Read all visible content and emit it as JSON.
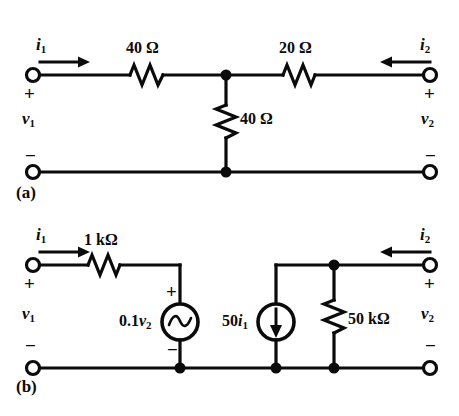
{
  "figure": {
    "ink_color": "#0b0b0b",
    "background": "#ffffff"
  },
  "circuit_a": {
    "part_label": "(a)",
    "current_in_label": "i",
    "current_in_sub": "1",
    "current_out_label": "i",
    "current_out_sub": "2",
    "voltage_left_label": "v",
    "voltage_left_sub": "1",
    "voltage_right_label": "v",
    "voltage_right_sub": "2",
    "plus_left": "+",
    "minus_left": "−",
    "plus_right": "+",
    "minus_right": "−",
    "series_left_resistor": "40 Ω",
    "series_right_resistor": "20 Ω",
    "shunt_resistor": "40 Ω"
  },
  "circuit_b": {
    "part_label": "(b)",
    "current_in_label": "i",
    "current_in_sub": "1",
    "current_out_label": "i",
    "current_out_sub": "2",
    "voltage_left_label": "v",
    "voltage_left_sub": "1",
    "voltage_right_label": "v",
    "voltage_right_sub": "2",
    "plus_left": "+",
    "minus_left": "−",
    "plus_right": "+",
    "minus_right": "−",
    "series_resistor": "1 kΩ",
    "shunt_resistor": "50 kΩ",
    "vcvs_label_prefix": "0.1",
    "vcvs_label_var": "v",
    "vcvs_label_sub": "2",
    "vcvs_plus": "+",
    "vcvs_minus": "−",
    "cccs_label_prefix": "50",
    "cccs_label_var": "i",
    "cccs_label_sub": "1"
  }
}
